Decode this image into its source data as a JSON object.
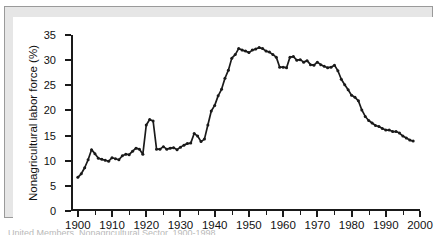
{
  "figure": {
    "caption": "United Members, Nonagricultural Sector, 1900-1998",
    "frame_color": "#e6e6e6",
    "canvas_color": "#ffffff",
    "line_color": "#1a1a1a"
  },
  "chart_data": {
    "type": "line",
    "title": "",
    "xlabel": "",
    "ylabel": "Nonagricultural labor force (%)",
    "xlim": [
      1898,
      2000
    ],
    "ylim": [
      0,
      35
    ],
    "grid": false,
    "legend": null,
    "marker": "filled-circle",
    "y_ticks": [
      0,
      5,
      10,
      15,
      20,
      25,
      30,
      35
    ],
    "y_tick_labels": [
      "0",
      "5",
      "10",
      "15",
      "20",
      "25",
      "30",
      "35"
    ],
    "x_ticks": [
      1900,
      1910,
      1920,
      1930,
      1940,
      1950,
      1960,
      1970,
      1980,
      1990,
      2000
    ],
    "x_tick_labels": [
      "1900",
      "1910",
      "1920",
      "1930",
      "1940",
      "1950",
      "1960",
      "1970",
      "1980",
      "1990",
      "2000"
    ],
    "x_minor_ticks": [
      1905,
      1915,
      1925,
      1935,
      1945,
      1955,
      1965,
      1975,
      1985,
      1995
    ],
    "series": [
      {
        "name": "Union membership share of nonagricultural labor force",
        "x": [
          1900,
          1901,
          1902,
          1903,
          1904,
          1905,
          1906,
          1907,
          1908,
          1909,
          1910,
          1911,
          1912,
          1913,
          1914,
          1915,
          1916,
          1917,
          1918,
          1919,
          1920,
          1921,
          1922,
          1923,
          1924,
          1925,
          1926,
          1927,
          1928,
          1929,
          1930,
          1931,
          1932,
          1933,
          1934,
          1935,
          1936,
          1937,
          1938,
          1939,
          1940,
          1941,
          1942,
          1943,
          1944,
          1945,
          1946,
          1947,
          1948,
          1949,
          1950,
          1951,
          1952,
          1953,
          1954,
          1955,
          1956,
          1957,
          1958,
          1959,
          1960,
          1961,
          1962,
          1963,
          1964,
          1965,
          1966,
          1967,
          1968,
          1969,
          1970,
          1971,
          1972,
          1973,
          1974,
          1975,
          1976,
          1977,
          1978,
          1979,
          1980,
          1981,
          1982,
          1983,
          1984,
          1985,
          1986,
          1987,
          1988,
          1989,
          1990,
          1991,
          1992,
          1993,
          1994,
          1995,
          1996,
          1997,
          1998
        ],
        "y": [
          6.7,
          7.4,
          8.6,
          10.2,
          12.2,
          11.4,
          10.5,
          10.3,
          10.1,
          9.9,
          10.6,
          10.4,
          10.2,
          11.0,
          11.3,
          11.2,
          11.9,
          12.5,
          12.3,
          11.3,
          17.1,
          18.2,
          17.9,
          12.3,
          12.3,
          12.8,
          12.3,
          12.5,
          12.6,
          12.2,
          12.7,
          13.1,
          13.4,
          13.5,
          15.4,
          14.9,
          13.8,
          14.3,
          17.1,
          19.9,
          21.0,
          22.9,
          24.2,
          26.4,
          28.0,
          30.4,
          31.1,
          32.3,
          32.0,
          31.8,
          31.5,
          32.0,
          32.2,
          32.5,
          32.3,
          31.8,
          31.6,
          31.1,
          30.6,
          28.6,
          28.6,
          28.5,
          30.6,
          30.7,
          30.0,
          30.1,
          29.6,
          29.9,
          29.1,
          29.0,
          29.6,
          29.1,
          28.8,
          28.5,
          28.6,
          29.0,
          27.9,
          26.2,
          25.1,
          24.1,
          23.0,
          22.6,
          21.9,
          20.1,
          18.8,
          18.0,
          17.5,
          17.0,
          16.8,
          16.4,
          16.1,
          16.1,
          15.8,
          15.8,
          15.5,
          14.9,
          14.5,
          14.1,
          13.9
        ]
      }
    ]
  },
  "axis": {
    "y_label_text": "Nonagricultural labor force (%)"
  }
}
